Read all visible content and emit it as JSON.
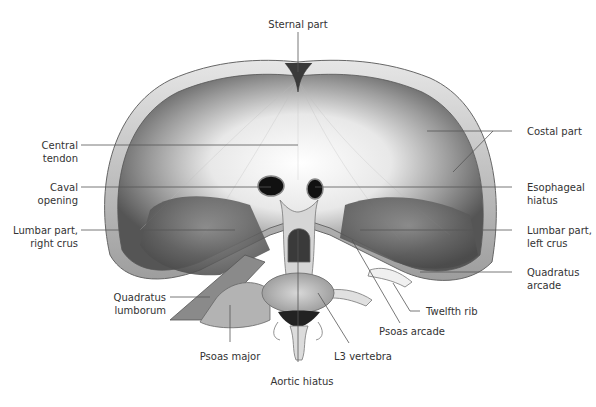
{
  "figure": {
    "labels": {
      "sternal_part": "Sternal part",
      "central_tendon": "Central\ntendon",
      "caval_opening": "Caval\nopening",
      "lumbar_right_crus": "Lumbar part,\nright crus",
      "quadratus_lumborum": "Quadratus\nlumborum",
      "psoas_major": "Psoas major",
      "aortic_hiatus": "Aortic hiatus",
      "l3_vertebra": "L3 vertebra",
      "psoas_arcade": "Psoas arcade",
      "twelfth_rib": "Twelfth rib",
      "quadratus_arcade": "Quadratus\narcade",
      "lumbar_left_crus": "Lumbar part,\nleft crus",
      "esophageal_hiatus": "Esophageal\nhiatus",
      "costal_part": "Costal part"
    },
    "colors": {
      "label_text": "#333333",
      "leader_line": "#555555",
      "muscle_dark": "#5a5a5a",
      "tendon_light": "#f2f2f2"
    }
  }
}
